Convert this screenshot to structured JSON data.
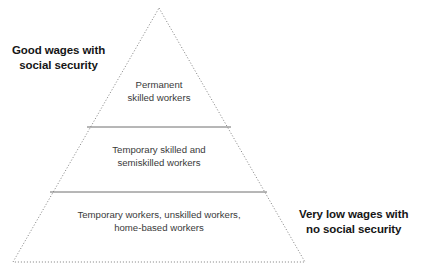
{
  "diagram": {
    "type": "pyramid",
    "background_color": "#ffffff",
    "outline_color": "#8a8a8a",
    "divider_color": "#6f6f6f",
    "label_color": "#161616",
    "tier_text_color": "#3a3a3a",
    "geometry": {
      "apex": [
        159,
        8
      ],
      "bottom_left": [
        13,
        262
      ],
      "bottom_right": [
        305,
        262
      ],
      "divider_1": {
        "y": 127,
        "x1": 87,
        "x2": 231
      },
      "divider_2": {
        "y": 192,
        "x1": 50,
        "x2": 267
      }
    },
    "tiers": [
      {
        "id": "top",
        "line1": "Permanent",
        "line2": "skilled workers"
      },
      {
        "id": "middle",
        "line1": "Temporary skilled and",
        "line2": "semiskilled workers"
      },
      {
        "id": "bottom",
        "line1": "Temporary workers, unskilled workers,",
        "line2": "home-based workers"
      }
    ],
    "labels": {
      "top_left": {
        "line1": "Good wages with",
        "line2": "social security"
      },
      "bottom_right": {
        "line1": "Very low wages with",
        "line2": "no social security"
      }
    }
  }
}
